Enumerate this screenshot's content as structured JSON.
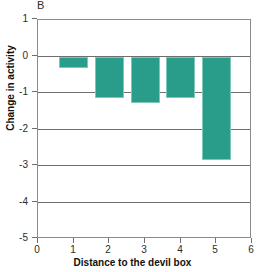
{
  "figure": {
    "panel_label": "B",
    "accent_color": "#2a9d8a",
    "axis_color": "#6e6e6e"
  },
  "chart_data": {
    "type": "bar",
    "title": "",
    "panel": "B",
    "xlabel": "Distance to the devil box",
    "ylabel": "Change in activity",
    "categories": [
      "1",
      "2",
      "3",
      "4",
      "5"
    ],
    "x": [
      1,
      2,
      3,
      4,
      5
    ],
    "values": [
      -0.3,
      -1.12,
      -1.25,
      -1.12,
      -2.82
    ],
    "bar_width": 0.8,
    "bar_color": "#2a9d8a",
    "xlim": [
      0,
      6
    ],
    "ylim": [
      -5,
      1
    ],
    "xticks": [
      0,
      1,
      2,
      3,
      4,
      5,
      6
    ],
    "xtick_labels": [
      "0",
      "1",
      "2",
      "3",
      "4",
      "5",
      "6"
    ],
    "yticks": [
      1,
      0,
      -1,
      -2,
      -3,
      -4,
      -5
    ],
    "ytick_labels": [
      "1",
      "0",
      "-1",
      "-2",
      "-3",
      "-4",
      "-5"
    ],
    "grid": true,
    "gridlines_y": [
      0,
      -1,
      -2,
      -3,
      -4
    ],
    "legend": null
  }
}
